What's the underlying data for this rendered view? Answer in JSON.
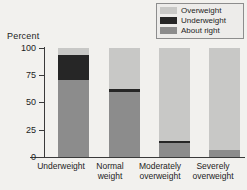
{
  "chart_data": {
    "type": "bar",
    "subtype": "stacked-100-percent",
    "title": "",
    "xlabel": "",
    "ylabel": "Percent",
    "ylim": [
      0,
      100
    ],
    "yticks": [
      0,
      25,
      50,
      75,
      100
    ],
    "ytick_labels": [
      "0",
      "25",
      "50",
      "75",
      "100"
    ],
    "grid": false,
    "legend_position": "top-right",
    "categories": [
      "Underweight",
      "Normal weight",
      "Moderately overweight",
      "Severely overweight"
    ],
    "category_lines": [
      [
        "Underweight"
      ],
      [
        "Normal",
        "weight"
      ],
      [
        "Moderately",
        "overweight"
      ],
      [
        "Severely",
        "overweight"
      ]
    ],
    "series": [
      {
        "name": "About right",
        "color": "#8c8c8c",
        "values": [
          71,
          60,
          13,
          6
        ]
      },
      {
        "name": "Underweight",
        "color": "#262626",
        "values": [
          23,
          2,
          2,
          0
        ]
      },
      {
        "name": "Overweight",
        "color": "#c8c8c6",
        "values": [
          6,
          38,
          85,
          94
        ]
      }
    ],
    "stack_order_bottom_to_top": [
      "About right",
      "Underweight",
      "Overweight"
    ]
  },
  "legend": {
    "entries": [
      {
        "label": "Overweight",
        "swatch_color": "#c8c8c6"
      },
      {
        "label": "Underweight",
        "swatch_color": "#262626"
      },
      {
        "label": "About right",
        "swatch_color": "#8c8c8c"
      }
    ]
  },
  "axes": {
    "y_title": "Percent",
    "y_ticks": [
      "100",
      "75",
      "50",
      "25",
      "0"
    ]
  }
}
